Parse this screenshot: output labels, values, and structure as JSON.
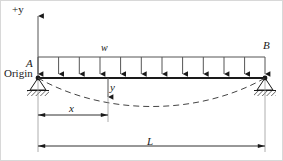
{
  "figure": {
    "labels": {
      "axis_plus_y": "+y",
      "support_left_point": "A",
      "origin": "Origin",
      "distributed_load": "w",
      "support_right_point": "B",
      "deflection": "y",
      "distance_x": "x",
      "span_L": "L"
    },
    "colors": {
      "line": "#1a1a1a",
      "thin_line": "#555555",
      "dashed_curve": "#444444",
      "hatch": "#333333",
      "border": "#d8d8d8",
      "background": "#ffffff"
    },
    "geometry": {
      "beam_left_x": 38,
      "beam_right_x": 265,
      "beam_y": 78,
      "load_line_y": 57,
      "n_load_arrows": 12,
      "axis_top_y": 14,
      "x_dim_y": 115,
      "x_dim_end": 108,
      "L_dim_y": 146,
      "max_deflection": 22
    }
  }
}
